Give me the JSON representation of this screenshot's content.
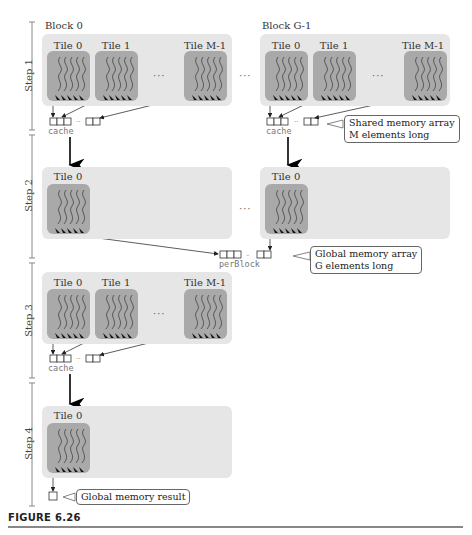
{
  "figure": {
    "caption": "FIGURE 6.26",
    "blocks": [
      "Block 0",
      "Block G-1"
    ],
    "steps": [
      "Step 1",
      "Step 2",
      "Step 3",
      "Step 4"
    ],
    "tiles": {
      "t0": "Tile 0",
      "t1": "Tile 1",
      "tm": "Tile M-1"
    },
    "ellipsis": "···",
    "arrays": {
      "cache": "cache",
      "perBlock": "perBlock"
    },
    "callouts": {
      "shared": [
        "Shared memory array",
        "M elements long"
      ],
      "global": [
        "Global memory array",
        "G elements long"
      ],
      "result": "Global memory result"
    },
    "colors": {
      "block_bg": "#e6e6e6",
      "tile_bg": "#a9a9a9",
      "arrow": "#111111"
    }
  }
}
